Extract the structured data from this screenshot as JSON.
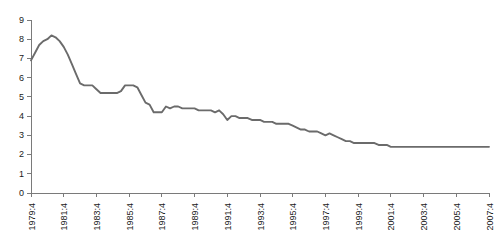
{
  "chart_data": {
    "type": "line",
    "title": "",
    "subtitle": "",
    "xlabel": "",
    "ylabel": "",
    "grid": false,
    "legend": false,
    "legend_position": "none",
    "line_color": "#6b6b6b",
    "axis_color": "#7a7a7a",
    "ylim": [
      0,
      9
    ],
    "ytick_labels": [
      "0",
      "1",
      "2",
      "3",
      "4",
      "5",
      "6",
      "7",
      "8",
      "9"
    ],
    "ytick_values": [
      0,
      1,
      2,
      3,
      4,
      5,
      6,
      7,
      8,
      9
    ],
    "xtick_labels": [
      "1979:4",
      "1981:4",
      "1983:4",
      "1985:4",
      "1987:4",
      "1989:4",
      "1991:4",
      "1993:4",
      "1995:4",
      "1997:4",
      "1999:4",
      "2001:4",
      "2003:4",
      "2005:4",
      "2007:4"
    ],
    "xtick_indices": [
      0,
      8,
      16,
      24,
      32,
      40,
      48,
      56,
      64,
      72,
      80,
      88,
      96,
      104,
      112
    ],
    "x": [
      "1979:4",
      "1980:1",
      "1980:2",
      "1980:3",
      "1980:4",
      "1981:1",
      "1981:2",
      "1981:3",
      "1981:4",
      "1982:1",
      "1982:2",
      "1982:3",
      "1982:4",
      "1983:1",
      "1983:2",
      "1983:3",
      "1983:4",
      "1984:1",
      "1984:2",
      "1984:3",
      "1984:4",
      "1985:1",
      "1985:2",
      "1985:3",
      "1985:4",
      "1986:1",
      "1986:2",
      "1986:3",
      "1986:4",
      "1987:1",
      "1987:2",
      "1987:3",
      "1987:4",
      "1988:1",
      "1988:2",
      "1988:3",
      "1988:4",
      "1989:1",
      "1989:2",
      "1989:3",
      "1989:4",
      "1990:1",
      "1990:2",
      "1990:3",
      "1990:4",
      "1991:1",
      "1991:2",
      "1991:3",
      "1991:4",
      "1992:1",
      "1992:2",
      "1992:3",
      "1992:4",
      "1993:1",
      "1993:2",
      "1993:3",
      "1993:4",
      "1994:1",
      "1994:2",
      "1994:3",
      "1994:4",
      "1995:1",
      "1995:2",
      "1995:3",
      "1995:4",
      "1996:1",
      "1996:2",
      "1996:3",
      "1996:4",
      "1997:1",
      "1997:2",
      "1997:3",
      "1997:4",
      "1998:1",
      "1998:2",
      "1998:3",
      "1998:4",
      "1999:1",
      "1999:2",
      "1999:3",
      "1999:4",
      "2000:1",
      "2000:2",
      "2000:3",
      "2000:4",
      "2001:1",
      "2001:2",
      "2001:3",
      "2001:4",
      "2002:1",
      "2002:2",
      "2002:3",
      "2002:4",
      "2003:1",
      "2003:2",
      "2003:3",
      "2003:4",
      "2004:1",
      "2004:2",
      "2004:3",
      "2004:4",
      "2005:1",
      "2005:2",
      "2005:3",
      "2005:4",
      "2006:1",
      "2006:2",
      "2006:3",
      "2006:4",
      "2007:1",
      "2007:2",
      "2007:3",
      "2007:4"
    ],
    "values": [
      6.9,
      7.3,
      7.7,
      7.9,
      8.0,
      8.2,
      8.1,
      7.9,
      7.6,
      7.2,
      6.7,
      6.2,
      5.7,
      5.6,
      5.6,
      5.6,
      5.4,
      5.2,
      5.2,
      5.2,
      5.2,
      5.2,
      5.3,
      5.6,
      5.6,
      5.6,
      5.5,
      5.1,
      4.7,
      4.6,
      4.2,
      4.2,
      4.2,
      4.5,
      4.4,
      4.5,
      4.5,
      4.4,
      4.4,
      4.4,
      4.4,
      4.3,
      4.3,
      4.3,
      4.3,
      4.2,
      4.3,
      4.1,
      3.8,
      4.0,
      4.0,
      3.9,
      3.9,
      3.9,
      3.8,
      3.8,
      3.8,
      3.7,
      3.7,
      3.7,
      3.6,
      3.6,
      3.6,
      3.6,
      3.5,
      3.4,
      3.3,
      3.3,
      3.2,
      3.2,
      3.2,
      3.1,
      3.0,
      3.1,
      3.0,
      2.9,
      2.8,
      2.7,
      2.7,
      2.6,
      2.6,
      2.6,
      2.6,
      2.6,
      2.6,
      2.5,
      2.5,
      2.5,
      2.4,
      2.4,
      2.4,
      2.4,
      2.4,
      2.4,
      2.4,
      2.4,
      2.4,
      2.4,
      2.4,
      2.4,
      2.4,
      2.4,
      2.4,
      2.4,
      2.4,
      2.4,
      2.4,
      2.4,
      2.4,
      2.4,
      2.4,
      2.4,
      2.4
    ]
  },
  "layout": {
    "plot_left": 31,
    "plot_right": 489,
    "plot_top": 20,
    "plot_bottom": 193,
    "tick_length": 4,
    "xlabel_offset": 6
  }
}
